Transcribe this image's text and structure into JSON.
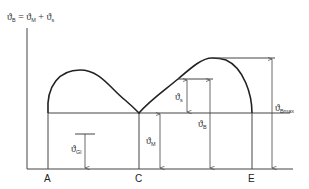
{
  "formula": {
    "lhs_symbol": "ϑ",
    "lhs_sub": "B",
    "eq": " = ",
    "term1_symbol": "ϑ",
    "term1_sub": "M",
    "plus": " + ",
    "term2_symbol": "ϑ",
    "term2_sub": "s"
  },
  "labels": {
    "theta_gl": {
      "symbol": "ϑ",
      "sub": "Gl"
    },
    "theta_m": {
      "symbol": "ϑ",
      "sub": "M"
    },
    "theta_s": {
      "symbol": "ϑ",
      "sub": "s"
    },
    "theta_b": {
      "symbol": "ϑ",
      "sub": "B"
    },
    "theta_bmax": {
      "symbol": "ϑ",
      "sub": "Bmax"
    }
  },
  "points": {
    "a": "A",
    "c": "C",
    "e": "E"
  },
  "colors": {
    "line": "#444444",
    "curve": "#222222",
    "background": "#ffffff"
  }
}
